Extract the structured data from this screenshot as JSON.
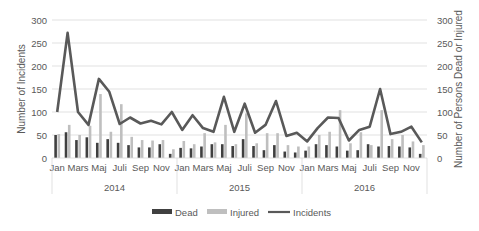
{
  "chart_data": {
    "type": "bar+line",
    "title": "",
    "ylabel_left": "Number of Incidents",
    "ylabel_right": "Number of Persons Dead or Injured",
    "ylim_left": [
      0,
      300
    ],
    "ylim_right": [
      0,
      300
    ],
    "yticks": [
      0,
      50,
      100,
      150,
      200,
      250,
      300
    ],
    "grid": true,
    "legend_position": "bottom",
    "years": [
      "2014",
      "2015",
      "2016"
    ],
    "month_tick_labels": [
      "Jan",
      "Mars",
      "Maj",
      "Juli",
      "Sep",
      "Nov"
    ],
    "categories": [
      "2014-Jan",
      "2014-Feb",
      "2014-Mar",
      "2014-Apr",
      "2014-May",
      "2014-Jun",
      "2014-Jul",
      "2014-Aug",
      "2014-Sep",
      "2014-Oct",
      "2014-Nov",
      "2014-Dec",
      "2015-Jan",
      "2015-Feb",
      "2015-Mar",
      "2015-Apr",
      "2015-May",
      "2015-Jun",
      "2015-Jul",
      "2015-Aug",
      "2015-Sep",
      "2015-Oct",
      "2015-Nov",
      "2015-Dec",
      "2016-Jan",
      "2016-Feb",
      "2016-Mar",
      "2016-Apr",
      "2016-May",
      "2016-Jun",
      "2016-Jul",
      "2016-Aug",
      "2016-Sep",
      "2016-Oct",
      "2016-Nov",
      "2016-Dec"
    ],
    "series": [
      {
        "name": "Dead",
        "type": "bar",
        "axis": "right",
        "color": "#404040",
        "values": [
          50,
          56,
          39,
          45,
          33,
          41,
          33,
          28,
          23,
          23,
          30,
          9,
          22,
          21,
          25,
          30,
          30,
          26,
          41,
          26,
          17,
          28,
          14,
          12,
          16,
          30,
          28,
          25,
          16,
          17,
          30,
          25,
          26,
          25,
          23,
          9
        ]
      },
      {
        "name": "Injured",
        "type": "bar",
        "axis": "right",
        "color": "#bfbfbf",
        "values": [
          52,
          72,
          50,
          70,
          139,
          57,
          117,
          46,
          39,
          38,
          39,
          19,
          37,
          30,
          54,
          34,
          72,
          30,
          97,
          32,
          54,
          54,
          28,
          25,
          25,
          50,
          57,
          104,
          32,
          56,
          28,
          104,
          41,
          50,
          36,
          28
        ]
      },
      {
        "name": "Incidents",
        "type": "line",
        "axis": "left",
        "color": "#595959",
        "values": [
          100,
          272,
          100,
          72,
          172,
          144,
          74,
          88,
          75,
          81,
          73,
          100,
          61,
          93,
          65,
          57,
          133,
          57,
          118,
          55,
          72,
          124,
          48,
          55,
          36,
          65,
          88,
          87,
          38,
          61,
          68,
          150,
          52,
          57,
          68,
          34
        ]
      }
    ]
  },
  "legend": [
    {
      "label": "Dead",
      "swatch": "bar",
      "color": "#404040"
    },
    {
      "label": "Injured",
      "swatch": "bar",
      "color": "#bfbfbf"
    },
    {
      "label": "Incidents",
      "swatch": "line",
      "color": "#595959"
    }
  ]
}
